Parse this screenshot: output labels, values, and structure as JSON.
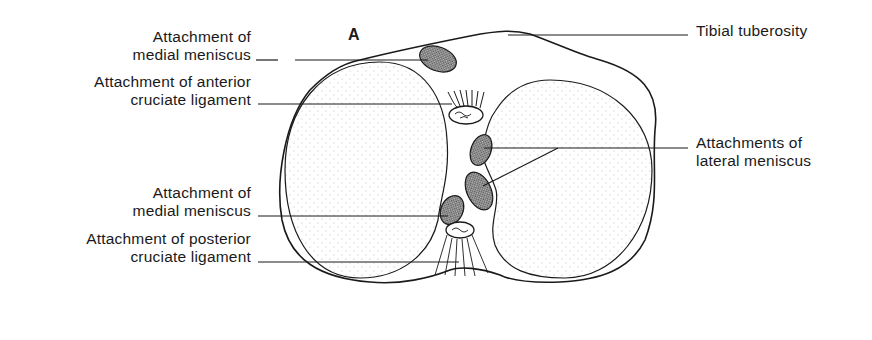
{
  "figure": {
    "panel_letter": "A",
    "labels": {
      "medial_meniscus_anterior": [
        "Attachment of",
        "medial meniscus"
      ],
      "acl": [
        "Attachment of anterior",
        "cruciate ligament"
      ],
      "medial_meniscus_posterior": [
        "Attachment of",
        "medial meniscus"
      ],
      "pcl": [
        "Attachment of posterior",
        "cruciate ligament"
      ],
      "tibial_tuberosity": [
        "Tibial tuberosity"
      ],
      "lateral_meniscus": [
        "Attachments of",
        "lateral meniscus"
      ]
    },
    "colors": {
      "line": "#1a1a1a",
      "hatch_fill": "#8a8a8a",
      "background": "#ffffff"
    }
  }
}
